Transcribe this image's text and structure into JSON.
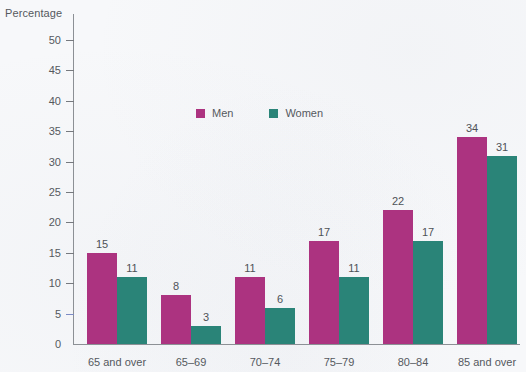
{
  "chart_data": {
    "type": "bar",
    "title": "",
    "xlabel": "",
    "ylabel": "Percentage",
    "ylim": [
      0,
      50
    ],
    "ytick_step": 5,
    "yticks": [
      0,
      5,
      10,
      15,
      20,
      25,
      30,
      35,
      40,
      45,
      50
    ],
    "grid": false,
    "legend_position": "top-center",
    "categories": [
      "65 and over",
      "65–69",
      "70–74",
      "75–79",
      "80–84",
      "85 and over"
    ],
    "series": [
      {
        "name": "Men",
        "color": "#ac3380",
        "values": [
          15,
          8,
          11,
          17,
          22,
          34
        ]
      },
      {
        "name": "Women",
        "color": "#2a8478",
        "values": [
          11,
          3,
          6,
          11,
          17,
          31
        ]
      }
    ]
  },
  "axis": {
    "y_title": "Percentage"
  },
  "colors": {
    "men": "#ac3380",
    "women": "#2a8478",
    "axis": "#8c9095",
    "tick": "#76797e",
    "tick_accent": "#7b8ac4",
    "text": "#55595e",
    "background": "#f7f8fa"
  }
}
